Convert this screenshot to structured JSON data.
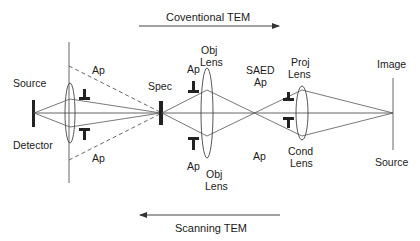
{
  "diagram": {
    "top_arrow": {
      "label": "Coventional TEM",
      "direction": "right"
    },
    "bottom_arrow": {
      "label": "Scanning TEM",
      "direction": "left"
    },
    "left_end": {
      "top_label": "Source",
      "bottom_label": "Detector"
    },
    "condenser_apertures": {
      "top_label": "Ap",
      "bottom_label": "Ap"
    },
    "specimen": {
      "label": "Spec"
    },
    "objective": {
      "top_label_line1": "Obj",
      "top_label_line2": "Lens",
      "bottom_label_line1": "Obj",
      "bottom_label_line2": "Lens",
      "ap_top": "Ap",
      "ap_bottom": "Ap"
    },
    "saed": {
      "top_label_line1": "SAED",
      "top_label_line2": "Ap",
      "bottom_label": "Ap"
    },
    "projector": {
      "top_label_line1": "Proj",
      "top_label_line2": "Lens",
      "bottom_label_line1": "Cond",
      "bottom_label_line2": "Lens"
    },
    "right_end": {
      "top_label": "Image",
      "bottom_label": "Source"
    },
    "colors": {
      "line": "#3a3a3a",
      "text": "#1a1a1a",
      "background": "#ffffff"
    }
  }
}
